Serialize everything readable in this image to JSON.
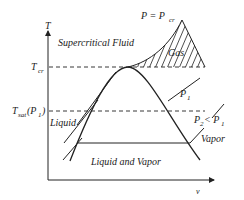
{
  "diagram": {
    "type": "T-v phase diagram",
    "axes": {
      "y_label": "T",
      "x_label": "v"
    },
    "labels": {
      "supercritical": "Supercritical Fluid",
      "gas": "Gas",
      "liquid": "Liquid",
      "vapor": "Vapor",
      "two_phase": "Liquid and Vapor",
      "t_cr_main": "T",
      "t_cr_sub": "cr",
      "t_sat_main": "T",
      "t_sat_sub": "sat",
      "t_sat_arg": "(P",
      "t_sat_arg_sub": "1",
      "t_sat_close": ")",
      "p_cr_main": "P = P",
      "p_cr_sub": "cr",
      "p1_main": "P",
      "p1_sub": "1",
      "p2_main": "P",
      "p2_sub": "2",
      "p2_rel": " < P",
      "p2_rel_sub": "1"
    },
    "colors": {
      "line": "#222222",
      "background": "#ffffff"
    }
  }
}
